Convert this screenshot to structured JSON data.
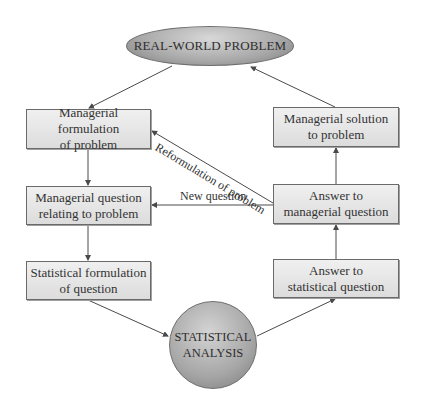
{
  "diagram": {
    "top_node": {
      "label": "REAL-WORLD PROBLEM"
    },
    "bottom_node": {
      "line1": "STATISTICAL",
      "line2": "ANALYSIS"
    },
    "left_boxes": [
      {
        "line1": "Managerial formulation",
        "line2": "of problem"
      },
      {
        "line1": "Managerial question",
        "line2": "relating to problem"
      },
      {
        "line1": "Statistical formulation",
        "line2": "of question"
      }
    ],
    "right_boxes": [
      {
        "line1": "Managerial solution",
        "line2": "to problem"
      },
      {
        "line1": "Answer to",
        "line2": "managerial question"
      },
      {
        "line1": "Answer to",
        "line2": "statistical question"
      }
    ],
    "edge_labels": {
      "reformulation": "Reformulation of problem",
      "new_question": "New question"
    },
    "colors": {
      "line": "#4a4a4a",
      "box_border": "#6a6a6a",
      "node_fill": "#a8a8a8"
    }
  }
}
